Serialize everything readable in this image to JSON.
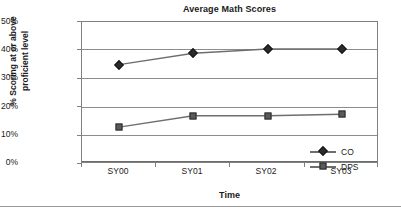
{
  "chart_data": {
    "type": "line",
    "title": "Average Math Scores",
    "xlabel": "Time",
    "ylabel": "% Scoring at or above proficient level",
    "ylabel_lines": [
      "% Scoring at or above",
      "proficient level"
    ],
    "categories": [
      "SY00",
      "SY01",
      "SY02",
      "SY03"
    ],
    "series": [
      {
        "name": "CO",
        "marker": "diamond",
        "values": [
          35,
          39,
          40.5,
          40.5
        ]
      },
      {
        "name": "DPS",
        "marker": "square",
        "values": [
          13,
          17,
          17,
          17.5
        ]
      }
    ],
    "ylim": [
      0,
      50
    ],
    "ytick_labels": [
      "50%",
      "40%",
      "30%",
      "20%",
      "10%",
      "0%"
    ],
    "ytick_values": [
      50,
      40,
      30,
      20,
      10,
      0
    ],
    "grid": "horizontal",
    "legend_position": "inside-bottom-right",
    "colors": {
      "series_co": "#2b2b2b",
      "series_dps": "#5a5a5a",
      "line": "#6e6e6e",
      "gridline": "#8c8c8c",
      "axis": "#808080",
      "text": "#1a1a1a",
      "background": "#ffffff"
    }
  }
}
